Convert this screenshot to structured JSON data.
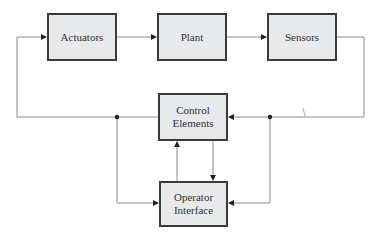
{
  "diagram": {
    "type": "control-system-block-diagram",
    "colors": {
      "box_fill": "#e7e9eb",
      "box_border": "#3a3a3a",
      "line": "#8a8a8a",
      "arrow": "#222222",
      "text": "#333333"
    },
    "blocks": {
      "actuators": {
        "label": "Actuators",
        "x": 47,
        "y": 13,
        "w": 70,
        "h": 48
      },
      "plant": {
        "label": "Plant",
        "x": 157,
        "y": 13,
        "w": 70,
        "h": 48
      },
      "sensors": {
        "label": "Sensors",
        "x": 267,
        "y": 13,
        "w": 70,
        "h": 48
      },
      "control_elements": {
        "line1": "Control",
        "line2": "Elements",
        "x": 158,
        "y": 93,
        "w": 70,
        "h": 48
      },
      "operator_interface": {
        "line1": "Operator",
        "line2": "Interface",
        "x": 159,
        "y": 181,
        "w": 69,
        "h": 46
      }
    },
    "connections": [
      {
        "from": "Actuators",
        "to": "Plant"
      },
      {
        "from": "Plant",
        "to": "Sensors"
      },
      {
        "from": "Sensors",
        "to": "Control Elements"
      },
      {
        "from": "Sensors",
        "to": "Operator Interface"
      },
      {
        "from": "Control Elements",
        "to": "Actuators"
      },
      {
        "from": "Control Elements",
        "to": "Operator Interface"
      },
      {
        "from": "Operator Interface",
        "to": "Control Elements"
      },
      {
        "from": "Control Elements (output junction)",
        "to": "Operator Interface"
      }
    ]
  }
}
